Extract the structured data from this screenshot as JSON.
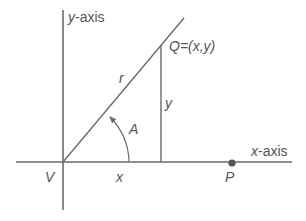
{
  "diagram": {
    "type": "polar-coordinate-triangle",
    "colors": {
      "line": "#6b6b6b",
      "text": "#555555",
      "point": "#555555"
    },
    "labels": {
      "y_axis": "y-axis",
      "x_axis": "x-axis",
      "point_q": "Q=(x,y)",
      "radius": "r",
      "height": "y",
      "base": "x",
      "angle": "A",
      "origin": "V",
      "point_p": "P"
    },
    "geometry": {
      "origin": [
        63,
        162
      ],
      "y_axis": {
        "x": 63,
        "y1": 10,
        "y2": 210
      },
      "x_axis": {
        "y": 162,
        "x1": 16,
        "x2": 292
      },
      "hypotenuse": {
        "from": [
          63,
          162
        ],
        "to": [
          184,
          18
        ]
      },
      "opposite": {
        "x": 161,
        "y1": 45,
        "y2": 162
      },
      "point_p": [
        232,
        162
      ],
      "angle_arc": {
        "radius": 66,
        "from_deg": 0,
        "to_deg": 50
      }
    }
  }
}
